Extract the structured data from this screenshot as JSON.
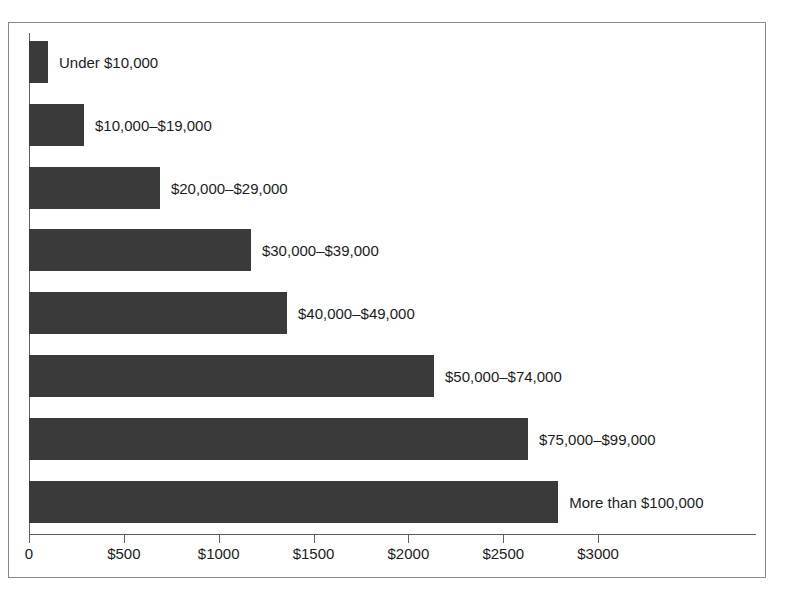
{
  "chart_data": {
    "type": "bar",
    "orientation": "horizontal",
    "title": "",
    "xlabel": "",
    "ylabel": "",
    "xlim": [
      0,
      3835
    ],
    "grid": false,
    "legend": false,
    "bar_color": "#3a3a3a",
    "frame_color": "#8a8a8a",
    "axis_color": "#5f5f5f",
    "categories": [
      "Under $10,000",
      "$10,000–$19,000",
      "$20,000–$29,000",
      "$30,000–$39,000",
      "$40,000–$49,000",
      "$50,000–$74,000",
      "$75,000–$99,000",
      "More than $100,000"
    ],
    "values": [
      100,
      290,
      690,
      1170,
      1360,
      2135,
      2630,
      2790
    ],
    "xticks": [
      0,
      500,
      1000,
      1500,
      2000,
      2500,
      3000
    ],
    "xticklabels": [
      "0",
      "$500",
      "$1000",
      "$1500",
      "$2000",
      "$2500",
      "$3000"
    ]
  },
  "bars": [
    {
      "label": "Under $10,000",
      "value": 100
    },
    {
      "label": "$10,000–$19,000",
      "value": 290
    },
    {
      "label": "$20,000–$29,000",
      "value": 690
    },
    {
      "label": "$30,000–$39,000",
      "value": 1170
    },
    {
      "label": "$40,000–$49,000",
      "value": 1360
    },
    {
      "label": "$50,000–$74,000",
      "value": 2135
    },
    {
      "label": "$75,000–$99,000",
      "value": 2630
    },
    {
      "label": "More than $100,000",
      "value": 2790
    }
  ],
  "ticks": [
    {
      "label": "0",
      "value": 0
    },
    {
      "label": "$500",
      "value": 500
    },
    {
      "label": "$1000",
      "value": 1000
    },
    {
      "label": "$1500",
      "value": 1500
    },
    {
      "label": "$2000",
      "value": 2000
    },
    {
      "label": "$2500",
      "value": 2500
    },
    {
      "label": "$3000",
      "value": 3000
    }
  ],
  "title": ""
}
